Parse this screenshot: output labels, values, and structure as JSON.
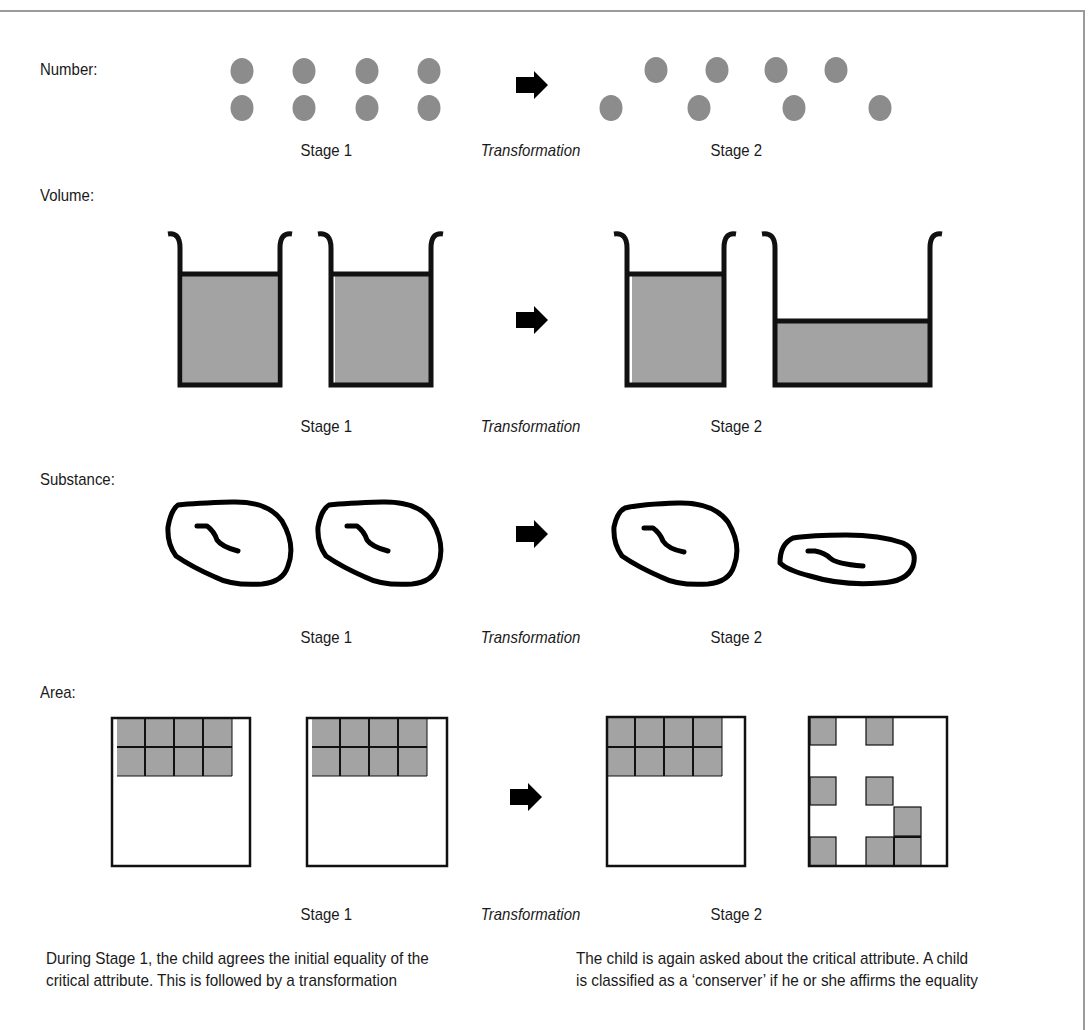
{
  "figure": {
    "rows": [
      {
        "id": "number",
        "label": "Number:",
        "stage1_caption": "Stage 1",
        "transform_caption": "Transformation",
        "stage2_caption": "Stage 2",
        "stage1": {
          "rows": 2,
          "dots_per_row": 4,
          "arrangement": "aligned"
        },
        "stage2": {
          "rows": 2,
          "dots_per_row": 4,
          "arrangement": "spread out bottom row"
        }
      },
      {
        "id": "volume",
        "label": "Volume:",
        "stage1_caption": "Stage 1",
        "transform_caption": "Transformation",
        "stage2_caption": "Stage 2",
        "stage1": [
          "tall narrow beaker filled",
          "tall narrow beaker filled"
        ],
        "stage2": [
          "tall narrow beaker filled",
          "wide beaker lower level"
        ]
      },
      {
        "id": "substance",
        "label": "Substance:",
        "stage1_caption": "Stage 1",
        "transform_caption": "Transformation",
        "stage2_caption": "Stage 2",
        "stage1": [
          "round clay ball",
          "round clay ball"
        ],
        "stage2": [
          "round clay ball",
          "flattened clay"
        ]
      },
      {
        "id": "area",
        "label": "Area:",
        "stage1_caption": "Stage 1",
        "transform_caption": "Transformation",
        "stage2_caption": "Stage 2",
        "stage1": {
          "squares": 8,
          "layout": "2x4 block top-left"
        },
        "stage2": {
          "squares": 8,
          "layout": "2x4 block top-left vs scattered"
        }
      }
    ],
    "colors": {
      "fill_gray": "#a0a0a0",
      "dot_gray": "#8c8c8c",
      "stroke": "#111111",
      "frame": "#9a9a9a"
    }
  },
  "text": {
    "left_paragraph": [
      "During Stage 1, the child agrees the initial equality of the",
      "critical attribute. This is followed by a transformation"
    ],
    "right_paragraph": [
      "The child is again asked about the critical attribute. A child",
      "is classified as a ‘conserver’ if he or she affirms the equality"
    ]
  }
}
